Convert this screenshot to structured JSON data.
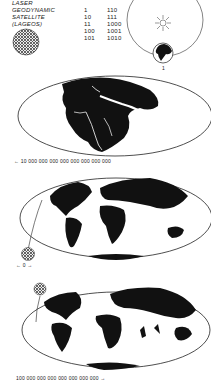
{
  "title": {
    "lines": [
      "LASER",
      "GEODYNAMIC",
      "SATELLITE",
      "(LAGEOS)"
    ]
  },
  "binary_counting": {
    "column1": [
      "1",
      "10",
      "11",
      "100",
      "101"
    ],
    "column2": [
      "110",
      "111",
      "1000",
      "1001",
      "1010"
    ]
  },
  "orbit_diagram": {
    "sun_icon": "sun-icon",
    "earth_label": "1"
  },
  "maps": [
    {
      "name": "past-supercontinent",
      "label": "← 10 000 000 000 000 000 000 000 000",
      "direction": "past"
    },
    {
      "name": "present-world",
      "label": "← 0 →",
      "direction": "present"
    },
    {
      "name": "future-world",
      "label": "100 000 000 000 000 000 000 000 →",
      "direction": "future"
    }
  ],
  "colors": {
    "ink": "#1a1a1a",
    "background": "#ffffff"
  }
}
